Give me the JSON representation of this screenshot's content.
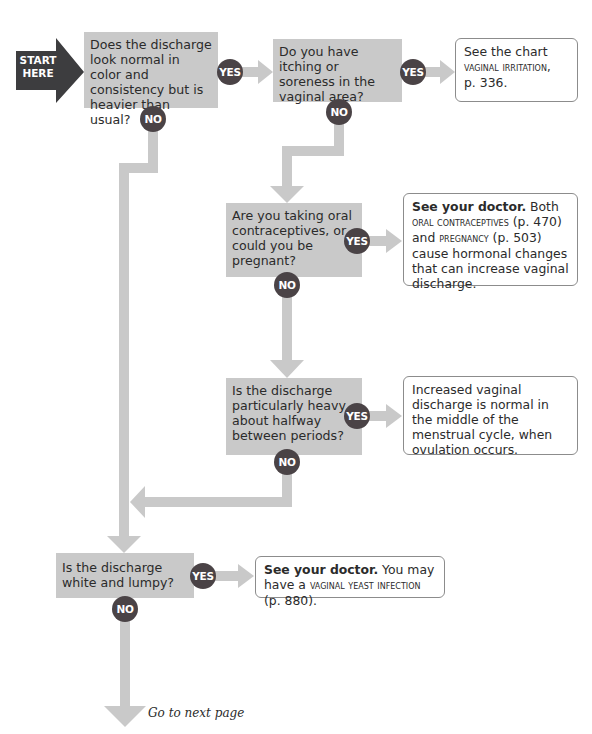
{
  "start": {
    "line1": "START",
    "line2": "HERE"
  },
  "colors": {
    "question_fill": "#c9c9c9",
    "connector": "#c9c9c9",
    "circle": "#4a4346",
    "start_arrow": "#3d3d3f",
    "result_border": "#8c8c8c"
  },
  "questions": [
    {
      "id": "q1",
      "text": "Does the discharge look normal in color and consistency but is heavier than usual?"
    },
    {
      "id": "q2",
      "text": "Do you have itching or soreness in the vaginal area?"
    },
    {
      "id": "q3",
      "text": "Are you taking oral contraceptives, or could you be pregnant?"
    },
    {
      "id": "q4",
      "text": "Is the discharge particularly heavy about halfway between periods?"
    },
    {
      "id": "q5",
      "text": "Is the discharge white and lumpy?"
    }
  ],
  "labels": {
    "yes": "YES",
    "no": "NO"
  },
  "results": [
    {
      "id": "r1",
      "parts": {
        "a": "See the chart",
        "b": "vaginal irritation,",
        "c": "p. 336."
      }
    },
    {
      "id": "r2",
      "parts": {
        "bold": "See your doctor.",
        "a": " Both ",
        "b": "oral contraceptives",
        "c": " (p. 470) and ",
        "d": "pregnancy",
        "e": " (p. 503) cause hormonal changes that can increase vaginal discharge."
      }
    },
    {
      "id": "r3",
      "text": "Increased vaginal discharge is normal in the middle of the menstrual cycle, when ovulation occurs."
    },
    {
      "id": "r4",
      "parts": {
        "bold": "See your doctor.",
        "a": " You may have a ",
        "b": "vaginal yeast infection",
        "c": " (p. 880)."
      }
    }
  ],
  "footer": {
    "next": "Go to next page"
  }
}
